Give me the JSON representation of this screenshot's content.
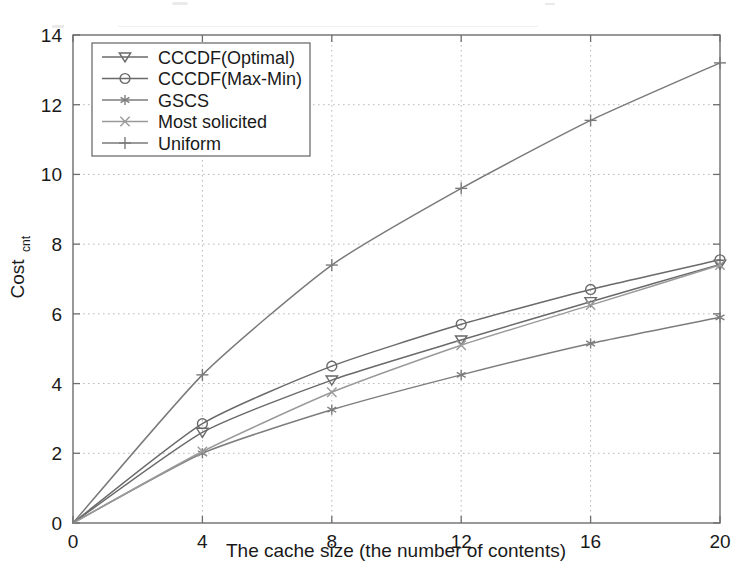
{
  "chart_data": {
    "type": "line",
    "title": "",
    "xlabel": "The cache size (the number of contents)",
    "ylabel": "Cost",
    "ylabel_sub": "cnt",
    "ylabel_full": "Cost_cnt",
    "x": [
      0,
      4,
      8,
      12,
      16,
      20
    ],
    "xlim": [
      0,
      20
    ],
    "ylim": [
      0,
      14
    ],
    "xticks": [
      0,
      4,
      8,
      12,
      16,
      20
    ],
    "yticks": [
      0,
      2,
      4,
      6,
      8,
      10,
      12,
      14
    ],
    "xtick_labels": [
      "0",
      "4",
      "8",
      "12",
      "16",
      "20"
    ],
    "ytick_labels": [
      "0",
      "2",
      "4",
      "6",
      "8",
      "10",
      "12",
      "14"
    ],
    "grid": true,
    "grid_style": "dotted",
    "legend_position": "upper-left",
    "series": [
      {
        "name": "CCCDF(Optimal)",
        "marker": "triangle-down",
        "color": "#6a6a6a",
        "values": [
          0,
          2.6,
          4.1,
          5.25,
          6.35,
          7.42
        ]
      },
      {
        "name": "CCCDF(Max-Min)",
        "marker": "circle",
        "color": "#6a6a6a",
        "values": [
          0,
          2.85,
          4.5,
          5.7,
          6.7,
          7.55
        ]
      },
      {
        "name": "GSCS",
        "marker": "asterisk",
        "color": "#7d7d7d",
        "values": [
          0,
          2.0,
          3.25,
          4.25,
          5.15,
          5.9
        ]
      },
      {
        "name": "Most solicited",
        "marker": "x-cross",
        "color": "#9a9a9a",
        "values": [
          0,
          2.05,
          3.75,
          5.1,
          6.25,
          7.4
        ]
      },
      {
        "name": "Uniform",
        "marker": "plus",
        "color": "#7a7a7a",
        "values": [
          0,
          4.25,
          7.4,
          9.6,
          11.55,
          13.2
        ]
      }
    ]
  },
  "colors": {
    "background": "#ffffff",
    "axis": "#6e6e6e",
    "grid": "#b9b9b9",
    "text": "#1a1a1a"
  }
}
